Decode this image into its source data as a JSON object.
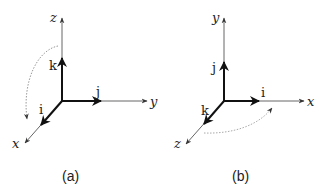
{
  "figures": [
    {
      "id": "a",
      "caption": "(a)",
      "axes": {
        "up": "z",
        "right": "y",
        "diag": "x"
      },
      "vectors": {
        "up": "k",
        "right": "j",
        "diag": "i"
      },
      "rotation_arrow": "dotted curve from z-axis toward x-axis"
    },
    {
      "id": "b",
      "caption": "(b)",
      "axes": {
        "up": "y",
        "right": "x",
        "diag": "z"
      },
      "vectors": {
        "up": "j",
        "right": "i",
        "diag": "k"
      },
      "rotation_arrow": "dotted curve from z-axis toward x-axis"
    }
  ],
  "colors": {
    "axis": "#555555",
    "vector": "#111111",
    "dotted": "#aaaaaa"
  }
}
